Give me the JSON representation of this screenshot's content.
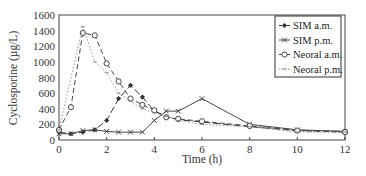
{
  "chart_data": {
    "type": "line",
    "title": "",
    "xlabel": "Time (h)",
    "ylabel": "Cyclosporine (µg/L)",
    "xlim": [
      0,
      12
    ],
    "ylim": [
      0,
      1600
    ],
    "xticks": [
      0,
      2,
      4,
      6,
      8,
      10,
      12
    ],
    "yticks": [
      0,
      200,
      400,
      600,
      800,
      1000,
      1200,
      1400,
      1600
    ],
    "grid": false,
    "legend_position": "upper right",
    "series": [
      {
        "name": "SIM a.m.",
        "marker": "filled-diamond",
        "line": "long-dash",
        "color": "#333333",
        "x": [
          0,
          0.5,
          1,
          1.5,
          2,
          2.5,
          3,
          3.5,
          4,
          4.5,
          5,
          6,
          8,
          10,
          12
        ],
        "y": [
          100,
          80,
          100,
          130,
          250,
          530,
          700,
          550,
          370,
          300,
          260,
          230,
          170,
          120,
          110
        ]
      },
      {
        "name": "SIM p.m.",
        "marker": "x",
        "line": "solid",
        "color": "#444444",
        "x": [
          0,
          0.5,
          1,
          1.5,
          2,
          2.5,
          3,
          3.5,
          4,
          4.5,
          5,
          6,
          8,
          10,
          12
        ],
        "y": [
          80,
          80,
          120,
          130,
          110,
          100,
          100,
          100,
          250,
          370,
          370,
          530,
          200,
          130,
          110
        ]
      },
      {
        "name": "Neoral a.m.",
        "marker": "open-circle",
        "line": "dashed",
        "color": "#444444",
        "x": [
          0,
          0.5,
          1,
          1.5,
          2,
          2.5,
          3,
          3.5,
          4,
          4.5,
          5,
          6,
          8,
          10,
          12
        ],
        "y": [
          130,
          420,
          1370,
          1340,
          980,
          750,
          530,
          450,
          380,
          290,
          270,
          240,
          180,
          120,
          100
        ]
      },
      {
        "name": "Neoral p.m.",
        "marker": "small-dash",
        "line": "dotted",
        "color": "#888888",
        "x": [
          0,
          1,
          1.5,
          2,
          2.5,
          3,
          3.5,
          4,
          4.5,
          5,
          6,
          8,
          10,
          12
        ],
        "y": [
          130,
          1450,
          1000,
          860,
          600,
          500,
          400,
          350,
          300,
          250,
          200,
          170,
          100,
          100
        ]
      }
    ]
  }
}
